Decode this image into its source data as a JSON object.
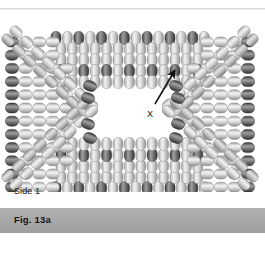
{
  "figure": {
    "title_band_label": "Fig. 13a",
    "side_label": "Side 1",
    "callout_label": "X",
    "colors": {
      "page_background": "#ffffff",
      "band_background": "#a9a9a9",
      "band_text": "#141414",
      "bead_dark": "#6f6f6f",
      "bead_dark_edge": "#3d3d3d",
      "bead_light": "#d9d9d9",
      "bead_light_edge": "#9a9a9a",
      "bead_mid": "#b8b8b8",
      "arrow": "#101010",
      "rule": "#d8d8d8"
    },
    "callout": {
      "label_x": 147,
      "label_y": 97,
      "arrow_tail_x": 155,
      "arrow_tail_y": 92,
      "arrow_head_x": 175,
      "arrow_head_y": 58
    },
    "layout": {
      "width": 265,
      "height": 254,
      "drawing_top": 12,
      "drawing_height": 180,
      "band_top": 208,
      "band_height": 25
    },
    "beads": {
      "bead_long": 13,
      "bead_short": 10,
      "top_row": {
        "y": 26,
        "x_start": 56,
        "count": 14,
        "step": 11.4,
        "pattern": [
          "dark",
          "light",
          "dark",
          "light",
          "dark",
          "light",
          "dark",
          "light",
          "dark",
          "light",
          "dark",
          "light",
          "dark",
          "light"
        ]
      },
      "top_inner_rows": [
        {
          "y": 37,
          "x_start": 61,
          "count": 13,
          "step": 11.4,
          "shade": "light"
        },
        {
          "y": 48,
          "x_start": 61,
          "count": 13,
          "step": 11.4,
          "shade": "light"
        },
        {
          "y": 59,
          "x_start": 61,
          "count": 13,
          "step": 11.4,
          "shade": "alt-dark"
        },
        {
          "y": 70,
          "x_start": 61,
          "count": 13,
          "step": 11.4,
          "shade": "light"
        }
      ],
      "bottom_row": {
        "y": 176,
        "x_start": 56,
        "count": 14,
        "step": 11.4,
        "pattern": [
          "dark",
          "light",
          "dark",
          "light",
          "dark",
          "light",
          "dark",
          "light",
          "dark",
          "light",
          "dark",
          "light",
          "dark",
          "light"
        ]
      },
      "bottom_inner_rows": [
        {
          "y": 165,
          "x_start": 61,
          "count": 13,
          "step": 11.4,
          "shade": "light"
        },
        {
          "y": 154,
          "x_start": 61,
          "count": 13,
          "step": 11.4,
          "shade": "light"
        },
        {
          "y": 143,
          "x_start": 61,
          "count": 13,
          "step": 11.4,
          "shade": "alt-dark"
        },
        {
          "y": 132,
          "x_start": 61,
          "count": 13,
          "step": 11.4,
          "shade": "light"
        }
      ],
      "left_column": {
        "x": 12,
        "y_start": 30,
        "count": 12,
        "step": 13.2,
        "shade": "dark"
      },
      "right_column": {
        "x": 248,
        "y_start": 30,
        "count": 12,
        "step": 13.2,
        "shade": "dark"
      }
    }
  }
}
